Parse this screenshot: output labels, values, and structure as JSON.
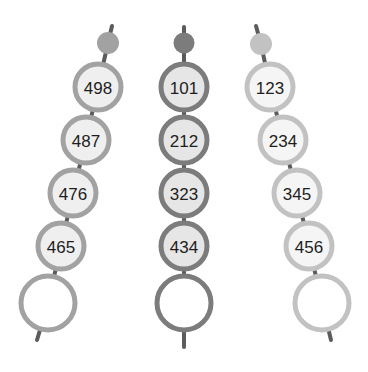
{
  "chains": [
    {
      "name": "left",
      "ring_color": "#a2a2a2",
      "fill_color": "#efefef",
      "beads": [
        "498",
        "487",
        "476",
        "465",
        ""
      ]
    },
    {
      "name": "middle",
      "ring_color": "#7c7c7c",
      "fill_color": "#e6e6e6",
      "beads": [
        "101",
        "212",
        "323",
        "434",
        ""
      ]
    },
    {
      "name": "right",
      "ring_color": "#c2c2c2",
      "fill_color": "#f5f5f5",
      "beads": [
        "123",
        "234",
        "345",
        "456",
        ""
      ]
    }
  ],
  "stick_color": "#5c5c5c"
}
